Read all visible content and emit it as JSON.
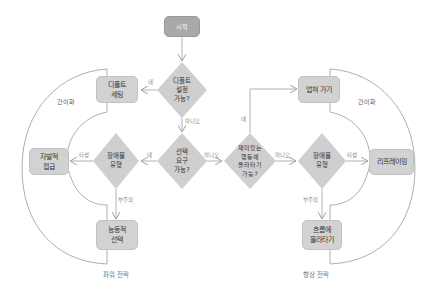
{
  "diagram": {
    "start": "시작",
    "left_strategy": {
      "caption": "파워 전략",
      "region_label": "간이화",
      "boxes": {
        "default_setting": "디폴트\n세팅",
        "self_access": "자발적\n접급",
        "active_choice": "능동적\n선택"
      }
    },
    "right_strategy": {
      "caption": "향상 전략",
      "region_label": "간이화",
      "boxes": {
        "carry_along": "업혀 가기",
        "reframing": "리프레이밍",
        "ride_flow": "흐름에\n올라타기"
      }
    },
    "decisions": {
      "default_possible": "디폴트\n설정\n가능?",
      "choice_request": "선택\n요구\n가능?",
      "obstacle_left": "장애물\n유형",
      "fun_behavior": "재미있는\n행동에\n올라타기\n가능?",
      "obstacle_right": "장애물\n유형"
    },
    "edge_labels": {
      "yes": "네",
      "no": "아니오",
      "inertia": "타성",
      "inattention": "부주의"
    },
    "colors": {
      "box_fill": "#d2d2d2",
      "start_fill": "#a9a9a9",
      "diamond_fill": "#cfcfcf",
      "line": "#a0a0a0",
      "region_stroke": "#8c8c8c"
    }
  }
}
